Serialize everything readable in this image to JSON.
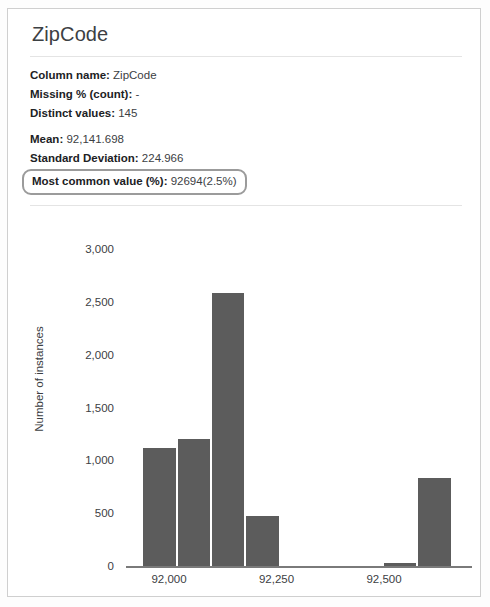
{
  "card": {
    "title": "ZipCode"
  },
  "stats": [
    {
      "label": "Column name:",
      "value": "ZipCode",
      "highlighted": false
    },
    {
      "label": "Missing % (count):",
      "value": "-",
      "highlighted": false
    },
    {
      "label": "Distinct values:",
      "value": "145",
      "highlighted": false
    },
    {
      "label": "Mean:",
      "value": "92,141.698",
      "highlighted": false
    },
    {
      "label": "Standard Deviation:",
      "value": "224.966",
      "highlighted": false
    },
    {
      "label": "Most common value (%):",
      "value": "92694(2.5%)",
      "highlighted": true
    }
  ],
  "colors": {
    "bar": "#5c5c5c",
    "axis": "#7a7a7a",
    "text": "#3c4043",
    "card_border": "#cfcfcf",
    "highlight_border": "#9b9b9b"
  },
  "chart_data": {
    "type": "bar",
    "title": "",
    "xlabel": "ZipCode",
    "ylabel": "Number of instances",
    "ylim": [
      0,
      3000
    ],
    "yticks": [
      0,
      500,
      1000,
      1500,
      2000,
      2500,
      3000
    ],
    "ytick_labels": [
      "0",
      "500",
      "1,000",
      "1,500",
      "2,000",
      "2,500",
      "3,000"
    ],
    "xlim": [
      91900,
      92700
    ],
    "xticks": [
      92000,
      92250,
      92500
    ],
    "xtick_labels": [
      "92,000",
      "92,250",
      "92,500"
    ],
    "grid": false,
    "legend": null,
    "bin_width": 80,
    "bins": [
      {
        "x_start": 91940,
        "x_end": 92020,
        "value": 1120
      },
      {
        "x_start": 92020,
        "x_end": 92100,
        "value": 1200
      },
      {
        "x_start": 92100,
        "x_end": 92180,
        "value": 2580
      },
      {
        "x_start": 92180,
        "x_end": 92260,
        "value": 470
      },
      {
        "x_start": 92500,
        "x_end": 92580,
        "value": 30
      },
      {
        "x_start": 92580,
        "x_end": 92660,
        "value": 830
      }
    ],
    "categories": [
      "91940-92020",
      "92020-92100",
      "92100-92180",
      "92180-92260",
      "92500-92580",
      "92580-92660"
    ],
    "values": [
      1120,
      1200,
      2580,
      470,
      30,
      830
    ]
  }
}
